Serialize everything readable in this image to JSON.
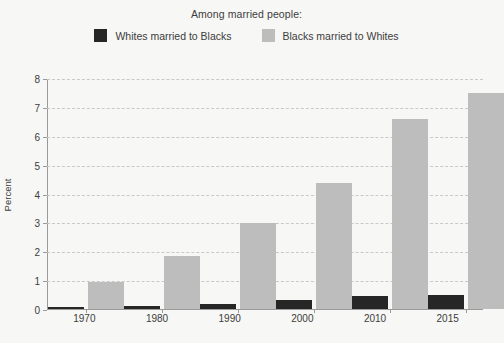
{
  "legend": {
    "title": "Among married people:",
    "entries": [
      {
        "label": "Whites married to Blacks",
        "color": "#262626",
        "swatch_name": "legend-swatch-black"
      },
      {
        "label": "Blacks married to Whites",
        "color": "#bdbdbd",
        "swatch_name": "legend-swatch-gray"
      }
    ]
  },
  "chart_data": {
    "type": "bar",
    "title": "Among married people:",
    "xlabel": "",
    "ylabel": "Percent",
    "categories": [
      "1970",
      "1980",
      "1990",
      "2000",
      "2010",
      "2015"
    ],
    "series": [
      {
        "name": "Whites married to Blacks",
        "color": "#262626",
        "values": [
          0.07,
          0.1,
          0.18,
          0.3,
          0.45,
          0.5
        ]
      },
      {
        "name": "Blacks married to Whites",
        "color": "#bdbdbd",
        "values": [
          0.95,
          1.85,
          3.0,
          4.4,
          6.6,
          7.5
        ]
      }
    ],
    "ylim": [
      0,
      8
    ],
    "yticks": [
      "0",
      "1",
      "2",
      "3",
      "4",
      "5",
      "6",
      "7",
      "8"
    ],
    "grid": true,
    "grid_style": "dashed",
    "legend_position": "top"
  },
  "colors": {
    "background": "#f7f7f5",
    "axis": "#9a9a9a",
    "grid": "#c9c9c9",
    "text": "#3c3c3c"
  }
}
